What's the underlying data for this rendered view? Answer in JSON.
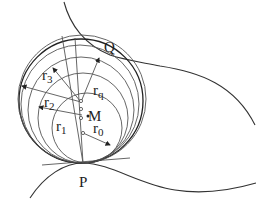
{
  "diagram": {
    "points": {
      "P": "P",
      "Q": "Q",
      "M": "M"
    },
    "radii": [
      {
        "base": "r",
        "sub": "0"
      },
      {
        "base": "r",
        "sub": "1"
      },
      {
        "base": "r",
        "sub": "2"
      },
      {
        "base": "r",
        "sub": "3"
      },
      {
        "base": "r",
        "sub": "q"
      }
    ],
    "colors": {
      "stroke": "#333333",
      "background": "#ffffff"
    }
  }
}
